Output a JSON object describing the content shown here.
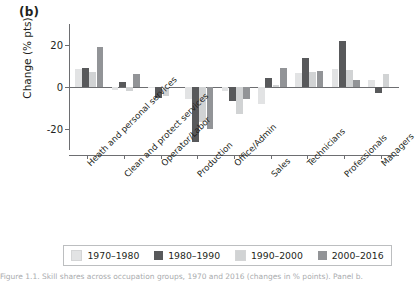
{
  "figure": {
    "panel_label": "(b)",
    "caption": "Figure 1.1. Skill shares across occupation groups, 1970 and 2016 (changes in % points). Panel b."
  },
  "legend": {
    "position": "bottom",
    "items": [
      {
        "label": "1970–1980",
        "color": "#e2e3e4"
      },
      {
        "label": "1980–1990",
        "color": "#58595b"
      },
      {
        "label": "1990–2000",
        "color": "#d1d3d4"
      },
      {
        "label": "2000–2016",
        "color": "#929497"
      }
    ]
  },
  "chart_data": {
    "type": "bar",
    "title": "(b)",
    "xlabel": "",
    "ylabel": "Change (% pts)",
    "ylim": [
      -30,
      30
    ],
    "yticks": [
      20,
      0,
      -20
    ],
    "ytick_labels": [
      "20",
      "0",
      "-20"
    ],
    "grid": false,
    "categories": [
      "Heath and personal services",
      "Clean and protect services",
      "Operator/Labor",
      "Production",
      "Office/Admin",
      "Sales",
      "Technicians",
      "Professionals",
      "Managers"
    ],
    "series": [
      {
        "name": "1970–1980",
        "color": "#e2e3e4",
        "values": [
          8.5,
          -1.2,
          -0.5,
          -5.5,
          -2.0,
          -8.0,
          6.5,
          8.5,
          3.5
        ]
      },
      {
        "name": "1980–1990",
        "color": "#58595b",
        "values": [
          9.0,
          2.5,
          -5.0,
          -26.0,
          -6.5,
          4.5,
          14.0,
          22.0,
          -3.0
        ]
      },
      {
        "name": "1990–2000",
        "color": "#d1d3d4",
        "values": [
          7.0,
          -2.0,
          -4.5,
          -16.5,
          -13.0,
          0.8,
          7.0,
          8.0,
          6.0
        ]
      },
      {
        "name": "2000–2016",
        "color": "#929497",
        "values": [
          19.0,
          6.0,
          0.0,
          -20.0,
          -5.5,
          9.0,
          7.5,
          3.5,
          0.0
        ]
      }
    ]
  }
}
